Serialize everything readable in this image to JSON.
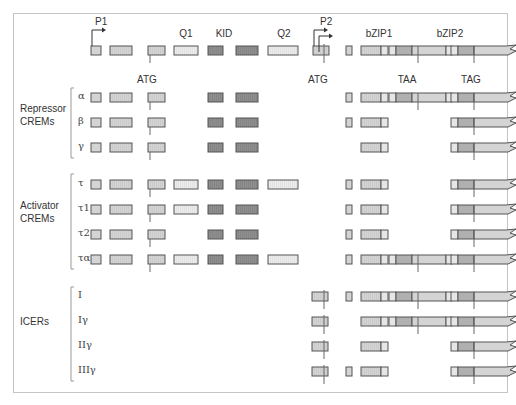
{
  "diagram": {
    "promoters": [
      {
        "label": "P1",
        "x": 93
      },
      {
        "label": "P2",
        "x": 318
      }
    ],
    "domain_labels": [
      {
        "label": "Q1",
        "x": 186
      },
      {
        "label": "KID",
        "x": 224
      },
      {
        "label": "Q2",
        "x": 284
      },
      {
        "label": "bZIP1",
        "x": 379
      },
      {
        "label": "bZIP2",
        "x": 450
      }
    ],
    "codon_labels": [
      {
        "label": "ATG",
        "x": 147,
        "y": 74
      },
      {
        "label": "ATG",
        "x": 318,
        "y": 74
      },
      {
        "label": "TAA",
        "x": 407,
        "y": 74
      },
      {
        "label": "TAG",
        "x": 471,
        "y": 74
      }
    ],
    "groups": [
      {
        "label": "Repressor\nCREMs",
        "y": 110
      },
      {
        "label": "Activator\nCREMs",
        "y": 207
      },
      {
        "label": "ICERs",
        "y": 323
      }
    ],
    "rows": [
      {
        "name": "gene",
        "label": "",
        "y": 50
      },
      {
        "name": "alpha",
        "label": "α",
        "y": 97
      },
      {
        "name": "beta",
        "label": "β",
        "y": 122
      },
      {
        "name": "gamma",
        "label": "γ",
        "y": 147
      },
      {
        "name": "tau",
        "label": "τ",
        "y": 184
      },
      {
        "name": "tau1",
        "label": "τ1",
        "y": 209
      },
      {
        "name": "tau2",
        "label": "τ2",
        "y": 234
      },
      {
        "name": "taualpha",
        "label": "τα",
        "y": 259
      },
      {
        "name": "I",
        "label": "I",
        "y": 296
      },
      {
        "name": "Igamma",
        "label": "Iγ",
        "y": 321
      },
      {
        "name": "IIgamma",
        "label": "IIγ",
        "y": 346
      },
      {
        "name": "IIIgamma",
        "label": "IIIγ",
        "y": 371
      }
    ],
    "colors": {
      "exon_light": "#d9d9d9",
      "exon_mid": "#c8c8c8",
      "exon_dark": "#8f8f8f",
      "exon_q": "#ececec",
      "exon_bzip_dark": "#b0b0b0",
      "stroke": "#555555",
      "frame": "#c4c4c4"
    }
  }
}
